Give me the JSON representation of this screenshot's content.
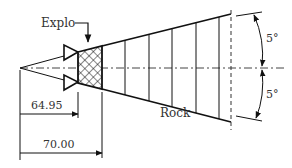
{
  "diagram": {
    "type": "blast-cone-geometry",
    "labels": {
      "explosive": "Explo",
      "medium": "Rock",
      "angle_upper": "5°",
      "angle_lower": "5°",
      "dim_inner": "64.95",
      "dim_outer": "70.00"
    },
    "colors": {
      "line": "#111111",
      "text": "#333333",
      "background": "#ffffff"
    }
  }
}
